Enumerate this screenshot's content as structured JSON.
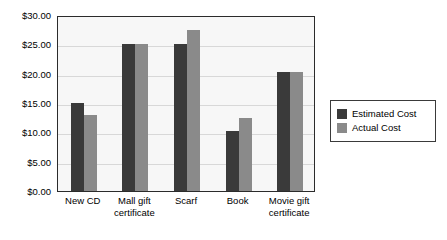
{
  "chart_data": {
    "type": "bar",
    "title": "",
    "xlabel": "",
    "ylabel": "",
    "ylim": [
      0,
      30
    ],
    "ytick_step": 5,
    "grid": true,
    "legend_position": "right",
    "currency_prefix": "$",
    "categories": [
      "New CD",
      "Mall gift certificate",
      "Scarf",
      "Book",
      "Movie gift certificate"
    ],
    "category_lines": [
      [
        "New CD"
      ],
      [
        "Mall gift",
        "certificate"
      ],
      [
        "Scarf"
      ],
      [
        "Book"
      ],
      [
        "Movie gift",
        "certificate"
      ]
    ],
    "ytick_labels": [
      "$0.00",
      "$5.00",
      "$10.00",
      "$15.00",
      "$20.00",
      "$25.00",
      "$30.00"
    ],
    "ytick_values": [
      0,
      5,
      10,
      15,
      20,
      25,
      30
    ],
    "series": [
      {
        "name": "Estimated Cost",
        "color": "#3a3a3a",
        "values": [
          15.0,
          25.0,
          25.0,
          10.25,
          20.25
        ]
      },
      {
        "name": "Actual Cost",
        "color": "#8a8a8a",
        "values": [
          13.0,
          25.0,
          27.5,
          12.5,
          20.25
        ]
      }
    ]
  },
  "legend": {
    "entries": [
      {
        "label": "Estimated Cost",
        "color": "#3a3a3a"
      },
      {
        "label": "Actual Cost",
        "color": "#8a8a8a"
      }
    ]
  },
  "colors": {
    "estimated": "#3a3a3a",
    "actual": "#8a8a8a",
    "plot_background": "#f7f7f7",
    "frame": "#2b2b2b",
    "gridline": "#d8d8d8",
    "page_background": "#ffffff"
  }
}
